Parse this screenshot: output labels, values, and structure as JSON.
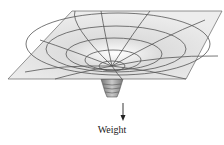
{
  "diagram": {
    "arrow_label": "Weight",
    "colors": {
      "sheet_fill": "#e9e9e9",
      "grid_line": "#555555",
      "funnel": "#9a9a9a",
      "text": "#1a1a1a"
    }
  }
}
